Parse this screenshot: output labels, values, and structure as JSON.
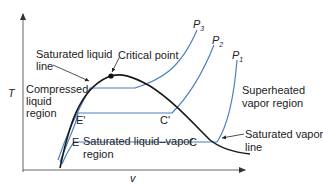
{
  "diagram": {
    "type": "T-v phase diagram",
    "axes": {
      "y_label": "T",
      "x_label": "v"
    },
    "labels": {
      "saturated_liquid_line_1": "Saturated liquid",
      "saturated_liquid_line_2": "line",
      "critical_point": "Critical point",
      "compressed_1": "Compressed",
      "compressed_2": "liquid",
      "compressed_3": "region",
      "superheated_1": "Superheated",
      "superheated_2": "vapor region",
      "sat_mix_1": "Saturated liquid–vapor",
      "sat_mix_2": "region",
      "sat_vapor_1": "Saturated vapor",
      "sat_vapor_2": "line",
      "point_E_prime": "E'",
      "point_C_prime": "C'",
      "point_E": "E",
      "point_C": "C"
    },
    "isobars": [
      {
        "name": "P",
        "sub": "3"
      },
      {
        "name": "P",
        "sub": "2"
      },
      {
        "name": "P",
        "sub": "1"
      }
    ],
    "colors": {
      "dome": "#1a1a1a",
      "isobar": "#4a7fc1",
      "axis": "#555555",
      "text": "#222222"
    }
  }
}
